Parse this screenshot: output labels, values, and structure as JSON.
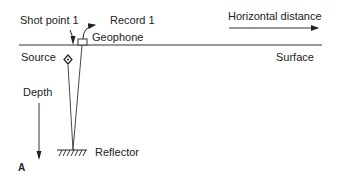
{
  "diagram": {
    "panel_label": "A",
    "labels": {
      "shot_point": "Shot point 1",
      "record": "Record 1",
      "geophone": "Geophone",
      "horizontal_distance": "Horizontal distance",
      "source": "Source",
      "surface": "Surface",
      "depth": "Depth",
      "reflector": "Reflector"
    },
    "colors": {
      "line": "#222222",
      "background": "#ffffff"
    }
  }
}
